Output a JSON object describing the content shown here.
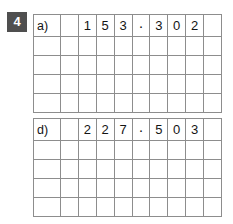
{
  "exercise": {
    "number": "4",
    "badge_color": "#4f4f4f",
    "badge_text_color": "#ffffff"
  },
  "style": {
    "grid_line_color": "#8d8d8d",
    "digit_color": "#141414",
    "background": "#ffffff"
  },
  "grids": [
    {
      "id": "a",
      "label": "a)",
      "number_text": "153·302",
      "decimal_separator": "·",
      "columns": 10,
      "rows": 5,
      "header_cells": [
        "a)",
        "",
        "1",
        "5",
        "3",
        "·",
        "3",
        "0",
        "2",
        ""
      ],
      "empty_rows": 4
    },
    {
      "id": "d",
      "label": "d)",
      "number_text": "227·503",
      "decimal_separator": "·",
      "columns": 10,
      "rows": 5,
      "header_cells": [
        "d)",
        "",
        "2",
        "2",
        "7",
        "·",
        "5",
        "0",
        "3",
        ""
      ],
      "empty_rows": 4
    }
  ]
}
